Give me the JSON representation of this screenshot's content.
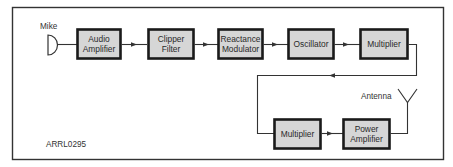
{
  "diagram": {
    "type": "block-diagram",
    "figure_id": "ARRL0295",
    "colors": {
      "frame": "#333333",
      "block_fill": "#d6d6d6",
      "block_border": "#1a1a1a",
      "line": "#333333",
      "text": "#2a2a2a"
    },
    "input": {
      "label": "Mike",
      "icon": "microphone-icon"
    },
    "output": {
      "label": "Antenna",
      "icon": "antenna-icon"
    },
    "blocks": [
      {
        "id": "audio_amplifier",
        "line1": "Audio",
        "line2": "Amplifier"
      },
      {
        "id": "clipper_filter",
        "line1": "Clipper",
        "line2": "Filter"
      },
      {
        "id": "reactance_modulator",
        "line1": "Reactance",
        "line2": "Modulator"
      },
      {
        "id": "oscillator",
        "line1": "Oscillator",
        "line2": ""
      },
      {
        "id": "multiplier_1",
        "line1": "Multiplier",
        "line2": ""
      },
      {
        "id": "multiplier_2",
        "line1": "Multiplier",
        "line2": ""
      },
      {
        "id": "power_amplifier",
        "line1": "Power",
        "line2": "Amplifier"
      }
    ],
    "connections": [
      {
        "from": "mike",
        "to": "audio_amplifier"
      },
      {
        "from": "audio_amplifier",
        "to": "clipper_filter"
      },
      {
        "from": "clipper_filter",
        "to": "reactance_modulator"
      },
      {
        "from": "reactance_modulator",
        "to": "oscillator"
      },
      {
        "from": "oscillator",
        "to": "multiplier_1"
      },
      {
        "from": "multiplier_1",
        "to": "multiplier_2"
      },
      {
        "from": "multiplier_2",
        "to": "power_amplifier"
      },
      {
        "from": "power_amplifier",
        "to": "antenna"
      }
    ]
  }
}
